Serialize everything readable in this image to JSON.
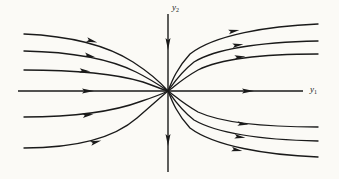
{
  "figure": {
    "kind": "phase-portrait",
    "caption": "",
    "background_color": "#fbfaf6",
    "stroke_color": "#1a1a1a"
  },
  "axes": {
    "vertical": {
      "label_var": "y",
      "label_sub": "2",
      "label_text": "y2",
      "x": 168,
      "y_top": 14,
      "y_bottom": 172,
      "arrows": [
        {
          "name": "upper-vertical-arrow",
          "x": 168,
          "y": 44,
          "direction": "down"
        },
        {
          "name": "lower-vertical-arrow",
          "x": 168,
          "y": 140,
          "direction": "down"
        }
      ]
    },
    "horizontal": {
      "label_var": "y",
      "label_sub": "1",
      "label_text": "y1",
      "y": 91,
      "x_left": 18,
      "x_right": 303,
      "arrows": [
        {
          "name": "left-horizontal-arrow",
          "x": 88,
          "y": 91,
          "direction": "right"
        },
        {
          "name": "right-horizontal-arrow",
          "x": 248,
          "y": 91,
          "direction": "right"
        }
      ]
    }
  },
  "equilibrium": {
    "name": "origin",
    "x": 168,
    "y": 91
  },
  "chart_data": {
    "type": "line",
    "title": "",
    "xlabel": "y1",
    "ylabel": "y2",
    "grid": false,
    "legend": "none",
    "trajectories": [
      {
        "name": "upper-left-outer",
        "quadrant": "upper-left",
        "path": "M 24,34 C 70,36 108,46 133,62 C 150,73 161,83 168,91",
        "arrow": {
          "x": 92,
          "y": 41,
          "angle": 16
        }
      },
      {
        "name": "upper-left-middle",
        "quadrant": "upper-left",
        "path": "M 24,51 C 74,52 112,60 136,72 C 152,80 162,87 168,91",
        "arrow": {
          "x": 90,
          "y": 56,
          "angle": 12
        }
      },
      {
        "name": "upper-left-inner",
        "quadrant": "upper-left",
        "path": "M 24,70 C 80,70 120,75 143,82 C 157,87 164,90 168,91",
        "arrow": {
          "x": 85,
          "y": 71,
          "angle": 6
        }
      },
      {
        "name": "lower-left-inner",
        "quadrant": "lower-left",
        "path": "M 24,117 C 80,117 118,110 142,101 C 157,96 164,93 168,91",
        "arrow": {
          "x": 88,
          "y": 115,
          "angle": -8
        }
      },
      {
        "name": "lower-left-outer",
        "quadrant": "lower-left",
        "path": "M 24,148 C 76,148 114,138 137,118 C 152,105 162,96 168,91",
        "arrow": {
          "x": 96,
          "y": 142,
          "angle": -16
        }
      },
      {
        "name": "upper-right-inner",
        "quadrant": "upper-right",
        "path": "M 168,91 C 174,87 182,79 198,70 C 224,57 272,54 318,54",
        "arrow": {
          "x": 240,
          "y": 57,
          "angle": -5
        }
      },
      {
        "name": "upper-right-middle",
        "quadrant": "upper-right",
        "path": "M 168,91 C 173,84 180,73 194,62 C 220,46 270,42 318,41",
        "arrow": {
          "x": 238,
          "y": 45,
          "angle": -7
        }
      },
      {
        "name": "upper-right-outer",
        "quadrant": "upper-right",
        "path": "M 168,91 C 172,81 177,68 190,54 C 214,35 268,26 318,24",
        "arrow": {
          "x": 234,
          "y": 31,
          "angle": -11
        }
      },
      {
        "name": "lower-right-inner",
        "quadrant": "lower-right",
        "path": "M 168,91 C 174,95 182,103 198,112 C 224,124 272,127 318,127",
        "arrow": {
          "x": 243,
          "y": 124,
          "angle": 5
        }
      },
      {
        "name": "lower-right-middle",
        "quadrant": "lower-right",
        "path": "M 168,91 C 173,98 180,109 194,120 C 220,135 270,140 318,141",
        "arrow": {
          "x": 240,
          "y": 137,
          "angle": 7
        }
      },
      {
        "name": "lower-right-outer",
        "quadrant": "lower-right",
        "path": "M 168,91 C 172,101 177,114 190,128 C 214,146 266,155 318,157",
        "arrow": {
          "x": 237,
          "y": 150,
          "angle": 11
        }
      }
    ]
  }
}
